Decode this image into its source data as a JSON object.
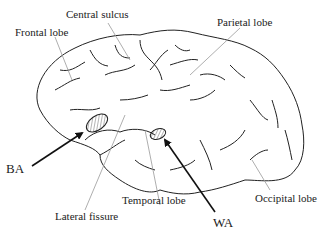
{
  "diagram": {
    "labels": {
      "central_sulcus": "Central sulcus",
      "frontal_lobe": "Frontal lobe",
      "parietal_lobe": "Parietal lobe",
      "ba": "BA",
      "wa": "WA",
      "temporal_lobe": "Temporal lobe",
      "lateral_fissure": "Lateral fissure",
      "occipital_lobe": "Occipital lobe"
    },
    "colors": {
      "outline": "#222222",
      "leader_line": "#999999",
      "arrow": "#111111"
    }
  }
}
